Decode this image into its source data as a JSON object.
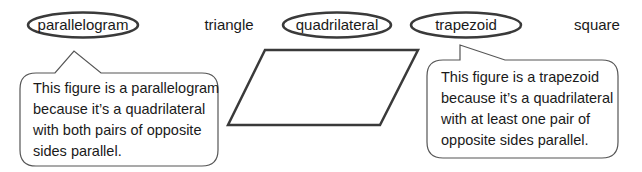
{
  "word_bank": [
    {
      "text": "parallelogram",
      "circled": true
    },
    {
      "text": "triangle",
      "circled": false
    },
    {
      "text": "quadrilateral",
      "circled": true
    },
    {
      "text": "trapezoid",
      "circled": true
    },
    {
      "text": "square",
      "circled": false
    }
  ],
  "figure": {
    "shape": "parallelogram"
  },
  "callouts": {
    "left": {
      "lines": [
        "This figure is a parallelogram",
        "because it’s a quadrilateral",
        "with both pairs of opposite",
        "sides parallel."
      ]
    },
    "right": {
      "lines": [
        "This figure is a trapezoid",
        "because it’s a quadrilateral",
        "with at least one pair of",
        "opposite sides parallel."
      ]
    }
  },
  "colors": {
    "stroke": "#3a3a3a",
    "text": "#1a1a1a",
    "background": "#ffffff"
  }
}
